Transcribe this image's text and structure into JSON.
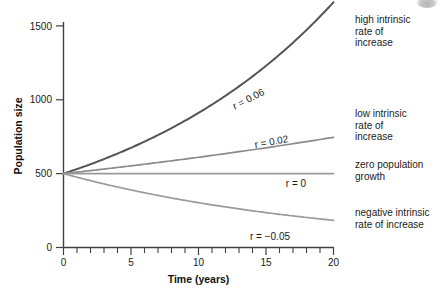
{
  "chart_data": {
    "type": "line",
    "title": "",
    "xlabel": "Time (years)",
    "ylabel": "Population size",
    "xlim": [
      0,
      20
    ],
    "ylim": [
      0,
      1550
    ],
    "grid": false,
    "legend_position": "right",
    "x_ticks": [
      0,
      5,
      10,
      15,
      20
    ],
    "x_tick_labels": [
      "0",
      "5",
      "10",
      "15",
      "20"
    ],
    "x_minor_tick_step": 1,
    "y_ticks": [
      0,
      500,
      1000,
      1500
    ],
    "y_tick_labels": [
      "0",
      "500",
      "1000",
      "1500"
    ],
    "initial_population": 500,
    "model": "N(t) = 500 * exp(r*t)",
    "x": [
      0,
      1,
      2,
      3,
      4,
      5,
      6,
      7,
      8,
      9,
      10,
      11,
      12,
      13,
      14,
      15,
      16,
      17,
      18,
      19,
      20
    ],
    "series": [
      {
        "name": "high intrinsic rate of increase",
        "r": 0.06,
        "inline_label": "r = 0.06",
        "color": "#555555",
        "values": [
          500,
          531,
          564,
          599,
          636,
          675,
          717,
          761,
          808,
          858,
          911,
          967,
          1027,
          1091,
          1158,
          1230,
          1306,
          1386,
          1472,
          1563,
          1660
        ]
      },
      {
        "name": "low intrinsic rate of increase",
        "r": 0.02,
        "inline_label": "r = 0.02",
        "color": "#8a8a8a",
        "values": [
          500,
          510,
          520,
          531,
          542,
          553,
          564,
          575,
          587,
          598,
          611,
          623,
          636,
          649,
          662,
          675,
          689,
          703,
          717,
          731,
          746
        ]
      },
      {
        "name": "zero population growth",
        "r": 0,
        "inline_label": "r = 0",
        "color": "#9a9a9a",
        "values": [
          500,
          500,
          500,
          500,
          500,
          500,
          500,
          500,
          500,
          500,
          500,
          500,
          500,
          500,
          500,
          500,
          500,
          500,
          500,
          500,
          500
        ]
      },
      {
        "name": "negative intrinsic rate of increase",
        "r": -0.05,
        "inline_label": "r = −0.05",
        "color": "#9a9a9a",
        "values": [
          500,
          476,
          452,
          430,
          409,
          389,
          370,
          352,
          335,
          319,
          303,
          288,
          274,
          261,
          248,
          236,
          225,
          214,
          203,
          193,
          184
        ]
      }
    ],
    "legend_entries": [
      {
        "key": "high",
        "label": "high intrinsic\nrate of\nincrease"
      },
      {
        "key": "low",
        "label": "low intrinsic\nrate of\nincrease"
      },
      {
        "key": "zero",
        "label": "zero population\ngrowth"
      },
      {
        "key": "negative",
        "label": "negative intrinsic\nrate of increase"
      }
    ],
    "inline_labels": {
      "high": "r = 0.06",
      "low": "r = 0.02",
      "zero": "r = 0",
      "negative": "r = −0.05"
    }
  }
}
